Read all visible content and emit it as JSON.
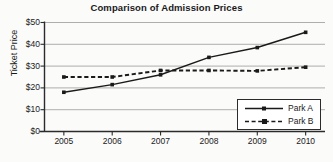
{
  "chart_data": {
    "type": "line",
    "title": "Comparison of Admission Prices",
    "xlabel": "",
    "ylabel": "Ticket Price",
    "x": [
      2005,
      2006,
      2007,
      2008,
      2009,
      2010
    ],
    "x_tick_labels": [
      "2005",
      "2006",
      "2007",
      "2008",
      "2009",
      "2010"
    ],
    "y_ticks": [
      0,
      10,
      20,
      30,
      40,
      50
    ],
    "y_tick_labels": [
      "$0",
      "$10",
      "$20",
      "$30",
      "$40",
      "$50"
    ],
    "ylim": [
      0,
      50
    ],
    "xlim": [
      2004.6,
      2010.4
    ],
    "grid": "horizontal",
    "legend_position": "bottom-right",
    "series": [
      {
        "name": "Park A",
        "style": "solid",
        "marker": "square",
        "color": "#1a1a1a",
        "values": [
          18,
          21.5,
          26,
          34,
          38.5,
          45.5
        ]
      },
      {
        "name": "Park B",
        "style": "dashed",
        "marker": "square",
        "color": "#1a1a1a",
        "values": [
          25,
          25,
          28,
          28,
          27.8,
          29.5
        ]
      }
    ]
  },
  "legend": {
    "items": [
      {
        "label": "Park A"
      },
      {
        "label": "Park B"
      }
    ]
  },
  "colors": {
    "background": "#fbfbfa",
    "axis": "#2b2b2b",
    "grid": "#9a9a9a",
    "text": "#1a1a1a"
  }
}
